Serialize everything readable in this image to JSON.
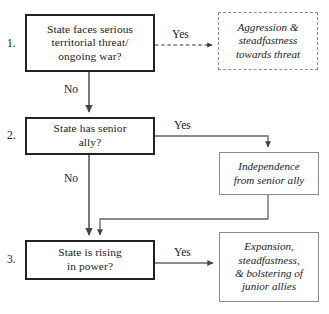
{
  "diagram": {
    "steps": [
      {
        "number": "1.",
        "question": "State faces serious territorial threat/ ongoing war?"
      },
      {
        "number": "2.",
        "question": "State has senior ally?"
      },
      {
        "number": "3.",
        "question": "State is rising in power?"
      }
    ],
    "outcomes": [
      {
        "id": "outcome-threat",
        "text": "Aggression & steadfastness towards threat",
        "style": "dashed"
      },
      {
        "id": "outcome-independence",
        "text": "Independence from senior ally",
        "style": "solid"
      },
      {
        "id": "outcome-expansion",
        "text": "Expansion, steadfastness, & bolstering of junior allies",
        "style": "solid"
      }
    ],
    "edge_labels": {
      "yes_1": "Yes",
      "no_1": "No",
      "yes_2": "Yes",
      "no_2": "No",
      "yes_3": "Yes"
    },
    "node_lines": {
      "step1": [
        "State faces serious",
        "territorial threat/",
        "ongoing war?"
      ],
      "step2": [
        "State has senior",
        "ally?"
      ],
      "step3": [
        "State is rising",
        "in power?"
      ],
      "outcome1": [
        "Aggression &",
        "steadfastness",
        "towards threat"
      ],
      "outcome2": [
        "Independence",
        "from senior ally"
      ],
      "outcome3": [
        "Expansion,",
        "steadfastness,",
        "& bolstering of",
        "junior allies"
      ]
    },
    "colors": {
      "decision_border": "#222222",
      "outcome_border": "#8a8a8a",
      "connector": "#555555",
      "dashed_connector": "#444444",
      "text": "#1a1a1a",
      "background": "#ffffff"
    }
  }
}
